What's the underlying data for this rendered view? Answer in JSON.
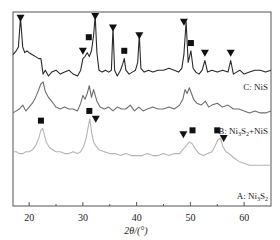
{
  "chart_data": {
    "type": "line",
    "title": "",
    "xlabel": "2θ/(°)",
    "ylabel": "",
    "xlim": [
      17,
      65
    ],
    "ylim": [
      0,
      100
    ],
    "xticks": [
      20,
      30,
      40,
      50,
      60
    ],
    "xtick_labels": [
      "20",
      "30",
      "40",
      "50",
      "60"
    ],
    "minor_xticks": [
      25,
      35,
      45,
      55
    ],
    "grid": false,
    "legend": "none",
    "marker_legend": {
      "square": "Ni3S2",
      "triangle": "NiS"
    },
    "series": [
      {
        "name": "C: NiS",
        "label_main": "C: NiS",
        "color": "#2a2a2a",
        "x": [
          17,
          17.6,
          18,
          18.4,
          18.8,
          19.2,
          19.6,
          20,
          20.6,
          21.2,
          21.8,
          22.2,
          22.6,
          23,
          23.6,
          24.2,
          25,
          25.8,
          26.6,
          27.4,
          28.2,
          29,
          29.6,
          30,
          30.4,
          30.8,
          31.2,
          31.6,
          32,
          32.3,
          32.6,
          33,
          33.6,
          34.2,
          34.8,
          35.3,
          35.6,
          35.9,
          36.4,
          37,
          37.4,
          37.7,
          38,
          38.6,
          39.2,
          39.8,
          40.2,
          40.5,
          40.8,
          41.4,
          42.2,
          43,
          44,
          45,
          46,
          47,
          47.8,
          48.4,
          48.8,
          49.2,
          49.6,
          50.1,
          50.5,
          51,
          51.6,
          52.2,
          52.7,
          53.2,
          54,
          55,
          56,
          57,
          57.5,
          58,
          58.6,
          59.2,
          60,
          61,
          62,
          63,
          64,
          65
        ],
        "y": [
          78,
          80,
          82,
          97,
          82,
          79,
          80,
          79,
          78,
          77,
          76,
          76,
          68,
          70,
          67,
          69,
          70,
          68,
          69,
          70,
          68,
          67,
          70,
          76,
          77,
          79,
          77,
          80,
          88,
          98,
          79,
          70,
          69,
          70,
          69,
          70,
          92,
          70,
          67,
          70,
          73,
          76,
          70,
          68,
          69,
          70,
          74,
          88,
          71,
          69,
          70,
          69,
          70,
          70,
          71,
          70,
          69,
          71,
          78,
          95,
          74,
          80,
          71,
          69,
          68,
          70,
          75,
          69,
          70,
          69,
          70,
          69,
          75,
          68,
          69,
          70,
          68,
          69,
          70,
          70,
          69,
          70
        ]
      },
      {
        "name": "B: Ni3S2+NiS",
        "label_main": "B: Ni",
        "label_sub1": "3",
        "label_mid": "S",
        "label_sub2": "2",
        "label_tail": "+NiS",
        "color": "#6e6e6e",
        "x": [
          17,
          17.6,
          18.2,
          18.8,
          19.4,
          20,
          20.6,
          21.2,
          21.8,
          22.2,
          22.6,
          23,
          23.6,
          24.2,
          25,
          25.8,
          26.6,
          27.4,
          28.2,
          29,
          29.6,
          30,
          30.4,
          30.8,
          31.2,
          31.6,
          32,
          32.6,
          33.2,
          34,
          34.8,
          35.6,
          36.4,
          37.2,
          38,
          38.8,
          39.6,
          40.4,
          41.2,
          42,
          43,
          44,
          45,
          46,
          47,
          48,
          48.6,
          49,
          49.4,
          49.8,
          50.2,
          50.6,
          51.2,
          52,
          52.8,
          53.4,
          54,
          55,
          56,
          57,
          58,
          59,
          60,
          61,
          62,
          63,
          64,
          65
        ],
        "y": [
          48,
          49,
          50,
          52,
          49,
          51,
          53,
          56,
          60,
          63,
          64,
          59,
          56,
          54,
          51,
          50,
          51,
          50,
          50,
          49,
          53,
          57,
          55,
          58,
          62,
          56,
          60,
          54,
          51,
          50,
          51,
          49,
          51,
          50,
          50,
          52,
          49,
          51,
          49,
          50,
          51,
          50,
          50,
          51,
          50,
          52,
          55,
          60,
          58,
          61,
          58,
          55,
          53,
          52,
          54,
          51,
          52,
          53,
          51,
          52,
          50,
          50,
          49,
          48,
          49,
          48,
          48,
          49
        ]
      },
      {
        "name": "A: Ni3S2",
        "label_main": "A: Ni",
        "label_sub1": "3",
        "label_mid": "S",
        "label_sub2": "2",
        "label_tail": "",
        "color": "#b4b4b4",
        "x": [
          17,
          17.6,
          18.2,
          18.8,
          19.4,
          20,
          20.6,
          21.2,
          21.8,
          22.2,
          22.5,
          22.8,
          23.2,
          23.8,
          24.4,
          25,
          25.8,
          26.6,
          27.4,
          28.2,
          29,
          29.6,
          30.2,
          30.6,
          31,
          31.3,
          31.6,
          32,
          32.4,
          33,
          34,
          35,
          36,
          37,
          38,
          39,
          40,
          41,
          42,
          43,
          44,
          45,
          46,
          47,
          48,
          48.6,
          49.2,
          49.8,
          50.4,
          51,
          51.6,
          52.4,
          53.2,
          54,
          54.6,
          55.1,
          55.6,
          56,
          56.6,
          57.2,
          58,
          59,
          60,
          61,
          62,
          63,
          64,
          65
        ],
        "y": [
          28,
          28,
          27,
          27,
          28,
          28,
          29,
          31,
          35,
          39,
          40,
          37,
          33,
          30,
          29,
          28,
          28,
          27,
          27,
          28,
          27,
          28,
          31,
          35,
          41,
          45,
          38,
          33,
          31,
          29,
          28,
          27,
          27,
          26,
          27,
          26,
          26,
          26,
          27,
          26,
          26,
          27,
          26,
          27,
          27,
          29,
          31,
          33,
          32,
          29,
          27,
          26,
          27,
          28,
          31,
          34,
          35,
          31,
          28,
          27,
          25,
          23,
          22,
          21,
          21,
          21,
          21,
          21
        ]
      }
    ],
    "markers": [
      {
        "series": "C: NiS",
        "shape": "triangle",
        "x": 18.4,
        "y": 97
      },
      {
        "series": "C: NiS",
        "shape": "triangle",
        "x": 30.0,
        "y": 80
      },
      {
        "series": "C: NiS",
        "shape": "square",
        "x": 31.1,
        "y": 87
      },
      {
        "series": "C: NiS",
        "shape": "triangle",
        "x": 32.3,
        "y": 98
      },
      {
        "series": "C: NiS",
        "shape": "triangle",
        "x": 35.6,
        "y": 92
      },
      {
        "series": "C: NiS",
        "shape": "square",
        "x": 37.7,
        "y": 80
      },
      {
        "series": "C: NiS",
        "shape": "triangle",
        "x": 40.5,
        "y": 88
      },
      {
        "series": "C: NiS",
        "shape": "triangle",
        "x": 48.8,
        "y": 95
      },
      {
        "series": "C: NiS",
        "shape": "square",
        "x": 50.1,
        "y": 84
      },
      {
        "series": "C: NiS",
        "shape": "triangle",
        "x": 52.7,
        "y": 79
      },
      {
        "series": "C: NiS",
        "shape": "triangle",
        "x": 57.5,
        "y": 79
      },
      {
        "series": "A: Ni3S2",
        "shape": "square",
        "x": 22.2,
        "y": 44
      },
      {
        "series": "A: Ni3S2",
        "shape": "square",
        "x": 31.2,
        "y": 49
      },
      {
        "series": "A: Ni3S2",
        "shape": "triangle",
        "x": 32.4,
        "y": 45
      },
      {
        "series": "A: Ni3S2",
        "shape": "triangle",
        "x": 48.7,
        "y": 37
      },
      {
        "series": "A: Ni3S2",
        "shape": "square",
        "x": 50.4,
        "y": 39
      },
      {
        "series": "A: Ni3S2",
        "shape": "square",
        "x": 55.0,
        "y": 39
      },
      {
        "series": "A: Ni3S2",
        "shape": "triangle",
        "x": 56.2,
        "y": 35
      }
    ]
  }
}
